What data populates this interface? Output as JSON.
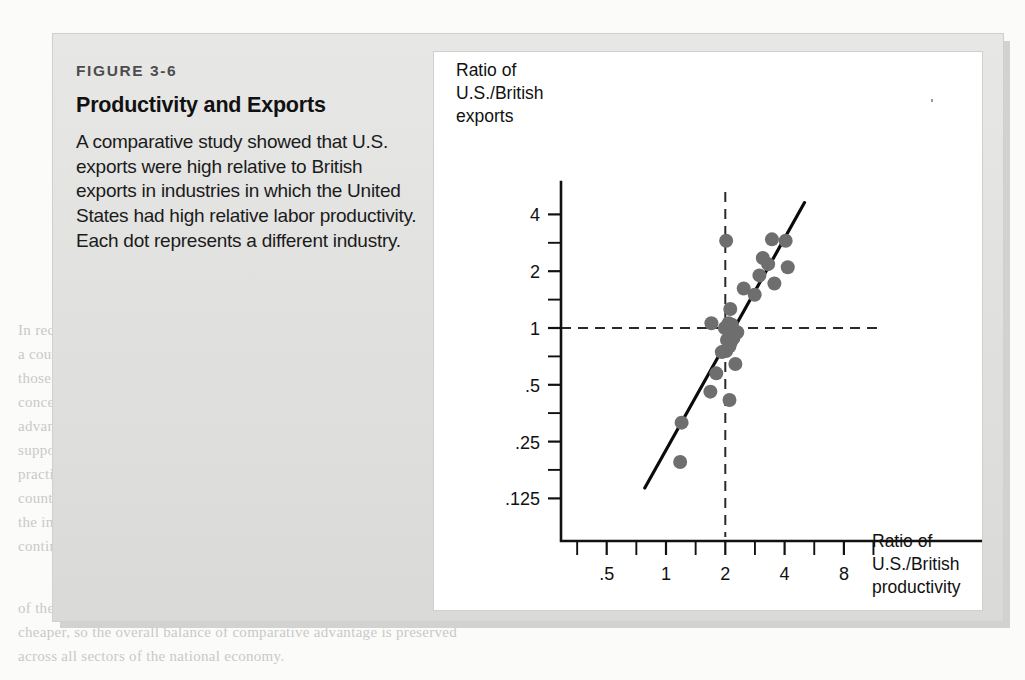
{
  "figure": {
    "number": "FIGURE 3-6",
    "title": "Productivity and Exports",
    "description": "A comparative study showed that U.S. exports were high relative to British exports in industries in which the United States had high relative labor productivity. Each dot represents a different industry.",
    "panel_bg": "#ffffff",
    "box_bg": "#dddddc"
  },
  "chart_data": {
    "type": "scatter",
    "title": "Productivity and Exports",
    "xlabel": "Ratio of U.S./British productivity",
    "ylabel": "Ratio of U.S./British exports",
    "xscale": "log",
    "yscale": "log",
    "xlim": [
      0.38,
      11.0
    ],
    "ylim": [
      0.1,
      5.6
    ],
    "grid": false,
    "legend": null,
    "xticklabels": [
      ".5",
      "1",
      "2",
      "4",
      "8"
    ],
    "xtickvalues": [
      0.5,
      1,
      2,
      4,
      8
    ],
    "yticklabels": [
      "4",
      "2",
      "1",
      ".5",
      ".25",
      ".125"
    ],
    "ytickvalues": [
      4,
      2,
      1,
      0.5,
      0.25,
      0.125
    ],
    "xminorticks": [
      0.354,
      0.707,
      1.414,
      2.828,
      5.657,
      11.3
    ],
    "yminorticks": [
      2.828,
      1.414,
      0.707,
      0.354,
      0.177
    ],
    "reference_lines": [
      {
        "orientation": "vertical",
        "value": 2,
        "style": "dashed"
      },
      {
        "orientation": "horizontal",
        "value": 1,
        "style": "dashed"
      }
    ],
    "trend_line": {
      "x": [
        0.78,
        5.05
      ],
      "y": [
        0.142,
        4.62
      ],
      "style": "solid"
    },
    "dot_color": "#6e6e6e",
    "dot_radius_px": 7,
    "points": [
      {
        "x": 1.18,
        "y": 0.195
      },
      {
        "x": 1.2,
        "y": 0.315
      },
      {
        "x": 1.68,
        "y": 0.46
      },
      {
        "x": 1.8,
        "y": 0.575
      },
      {
        "x": 2.1,
        "y": 0.415
      },
      {
        "x": 2.25,
        "y": 0.645
      },
      {
        "x": 1.92,
        "y": 0.745
      },
      {
        "x": 2.02,
        "y": 0.755
      },
      {
        "x": 2.1,
        "y": 0.8
      },
      {
        "x": 2.14,
        "y": 0.845
      },
      {
        "x": 2.04,
        "y": 0.865
      },
      {
        "x": 2.2,
        "y": 0.885
      },
      {
        "x": 1.7,
        "y": 1.06
      },
      {
        "x": 1.99,
        "y": 1.0
      },
      {
        "x": 2.08,
        "y": 1.06
      },
      {
        "x": 2.16,
        "y": 1.04
      },
      {
        "x": 2.3,
        "y": 0.95
      },
      {
        "x": 2.12,
        "y": 1.26
      },
      {
        "x": 2.48,
        "y": 1.62
      },
      {
        "x": 2.82,
        "y": 1.5
      },
      {
        "x": 2.98,
        "y": 1.9
      },
      {
        "x": 3.1,
        "y": 2.35
      },
      {
        "x": 3.3,
        "y": 2.18
      },
      {
        "x": 3.55,
        "y": 1.72
      },
      {
        "x": 3.45,
        "y": 2.95
      },
      {
        "x": 4.05,
        "y": 2.9
      },
      {
        "x": 4.15,
        "y": 2.1
      },
      {
        "x": 2.02,
        "y": 2.9
      }
    ]
  },
  "axes_labels": {
    "y_line1": "Ratio of",
    "y_line2": "U.S./British",
    "y_line3": "exports",
    "x_line1": "Ratio of",
    "x_line2": "U.S./British",
    "x_line3": "productivity"
  },
  "ghost_text": {
    "lines": [
      "productivity and wages. This is the reason",
      "that a country whose labor is",
      "less productive than the rest of the world",
      "will be cheaper than the",
      "productivity might be low, but can still be",
      "of the world. The",
      "of the nation's",
      "labor productivity that",
      "are less",
      "of the",
      "In recent years a number of policy analysts",
      "in the advanced",
      "small countries whose workers receive",
      "are new evidence",
      "show that a country can have a",
      "they are not",
      "where the wages are",
      "where the",
      "to the United States or Western Europe",
      "as China. The most",
      "in extremely low-wage countries like the",
      "even at the",
      "can still be competitive, even if it can be",
      "a country is",
      "terms, a country's goods will simply become",
      "become",
      "a strong national and industrial base, or has use of high manufacturing",
      "",
      "the important world's most important countries a large share of all",
      ""
    ]
  }
}
